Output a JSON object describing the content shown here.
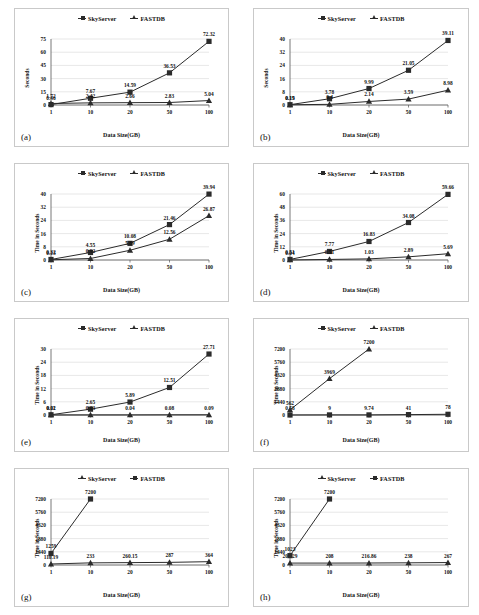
{
  "figure": {
    "panels": [
      {
        "tag": "(a)",
        "ylabel": "Seconds",
        "xlabel": "Data Size(GB)",
        "legend": [
          {
            "name": "SkyServer",
            "marker": "square"
          },
          {
            "name": "FASTDB",
            "marker": "triangle"
          }
        ],
        "chart_data": {
          "type": "line",
          "title": "",
          "xlabel": "Data Size(GB)",
          "ylabel": "Seconds",
          "categories": [
            "1",
            "10",
            "20",
            "50",
            "100"
          ],
          "yticks": [
            0,
            15,
            30,
            45,
            60,
            75
          ],
          "ylim": [
            0,
            75
          ],
          "grid": true,
          "legend_position": "top-center",
          "series": [
            {
              "name": "SkyServer",
              "marker": "square",
              "values": [
                0.46,
                7.67,
                14.59,
                36.53,
                72.32
              ],
              "labels": [
                "0.46",
                "7.67",
                "14.59",
                "36.53",
                "72.32"
              ]
            },
            {
              "name": "FASTDB",
              "marker": "triangle",
              "values": [
                1.72,
                2.42,
                2.66,
                2.83,
                5.04
              ],
              "labels": [
                "1.72",
                "2.42",
                "2.66",
                "2.83",
                "5.04"
              ]
            }
          ]
        }
      },
      {
        "tag": "(b)",
        "ylabel": "Seconds",
        "xlabel": "Data Size(GB)",
        "legend": [
          {
            "name": "SkyServer",
            "marker": "square"
          },
          {
            "name": "FASTDB",
            "marker": "triangle"
          }
        ],
        "chart_data": {
          "type": "line",
          "title": "",
          "xlabel": "Data Size(GB)",
          "ylabel": "Seconds",
          "categories": [
            "1",
            "10",
            "20",
            "50",
            "100"
          ],
          "yticks": [
            0,
            8,
            16,
            24,
            32,
            40
          ],
          "ylim": [
            0,
            40
          ],
          "grid": true,
          "legend_position": "top-center",
          "series": [
            {
              "name": "SkyServer",
              "marker": "square",
              "values": [
                0.19,
                3.78,
                9.99,
                21.05,
                39.11
              ],
              "labels": [
                "0.19",
                "3.78",
                "9.99",
                "21.05",
                "39.11"
              ]
            },
            {
              "name": "FASTDB",
              "marker": "triangle",
              "values": [
                0.15,
                0.4,
                2.14,
                3.59,
                8.98
              ],
              "labels": [
                "0.15",
                "0.4",
                "2.14",
                "3.59",
                "8.98"
              ]
            }
          ]
        }
      },
      {
        "tag": "(c)",
        "ylabel": "Time in Seconds",
        "xlabel": "Data Size(GB)",
        "legend": [
          {
            "name": "SkyServer",
            "marker": "square"
          },
          {
            "name": "FASTDB",
            "marker": "triangle"
          }
        ],
        "chart_data": {
          "type": "line",
          "title": "",
          "xlabel": "Data Size(GB)",
          "ylabel": "Time in Seconds",
          "categories": [
            "1",
            "10",
            "20",
            "50",
            "100"
          ],
          "yticks": [
            0,
            8,
            16,
            24,
            32,
            40
          ],
          "ylim": [
            0,
            40
          ],
          "grid": true,
          "legend_position": "top-center",
          "series": [
            {
              "name": "SkyServer",
              "marker": "square",
              "values": [
                0.32,
                4.55,
                10.08,
                21.46,
                39.94
              ],
              "labels": [
                "0.32",
                "4.55",
                "10.08",
                "21.46",
                "39.94"
              ]
            },
            {
              "name": "FASTDB",
              "marker": "triangle",
              "values": [
                0.13,
                0.92,
                5.89,
                12.56,
                26.87
              ],
              "labels": [
                "0.13",
                "0.92",
                "5.89",
                "12.56",
                "26.87"
              ]
            }
          ]
        }
      },
      {
        "tag": "(d)",
        "ylabel": "Time in Seconds",
        "xlabel": "Data Size(GB)",
        "legend": [
          {
            "name": "SkyServer",
            "marker": "square"
          },
          {
            "name": "FASTDB",
            "marker": "triangle"
          }
        ],
        "chart_data": {
          "type": "line",
          "title": "",
          "xlabel": "Data Size(GB)",
          "ylabel": "Time in Seconds",
          "categories": [
            "1",
            "10",
            "20",
            "50",
            "100"
          ],
          "yticks": [
            0,
            12,
            24,
            36,
            48,
            60
          ],
          "ylim": [
            0,
            60
          ],
          "grid": true,
          "legend_position": "top-center",
          "series": [
            {
              "name": "SkyServer",
              "marker": "square",
              "values": [
                0.51,
                7.77,
                16.83,
                34.08,
                59.66
              ],
              "labels": [
                "0.51",
                "7.77",
                "16.83",
                "34.08",
                "59.66"
              ]
            },
            {
              "name": "FASTDB",
              "marker": "triangle",
              "values": [
                0.04,
                0.51,
                1.03,
                2.89,
                5.69
              ],
              "labels": [
                "0.04",
                "0.51",
                "1.03",
                "2.89",
                "5.69"
              ]
            }
          ]
        }
      },
      {
        "tag": "(e)",
        "ylabel": "Time in Seconds",
        "xlabel": "Data Size(GB)",
        "legend": [
          {
            "name": "SkyServer",
            "marker": "square"
          },
          {
            "name": "FASTDB",
            "marker": "triangle"
          }
        ],
        "chart_data": {
          "type": "line",
          "title": "",
          "xlabel": "Data Size(GB)",
          "ylabel": "Time in Seconds",
          "categories": [
            "1",
            "10",
            "20",
            "50",
            "100"
          ],
          "yticks": [
            0,
            6,
            12,
            18,
            24,
            30
          ],
          "ylim": [
            0,
            30
          ],
          "grid": true,
          "legend_position": "top-center",
          "series": [
            {
              "name": "SkyServer",
              "marker": "square",
              "values": [
                0.11,
                2.65,
                5.89,
                12.51,
                27.71
              ],
              "labels": [
                "0.11",
                "2.65",
                "5.89",
                "12.51",
                "27.71"
              ]
            },
            {
              "name": "FASTDB",
              "marker": "triangle",
              "values": [
                0.02,
                0.03,
                0.04,
                0.08,
                0.09
              ],
              "labels": [
                "0.02",
                "0.03",
                "0.04",
                "0.08",
                "0.09"
              ]
            }
          ]
        }
      },
      {
        "tag": "(f)",
        "ylabel": "Time in Seconds",
        "xlabel": "Data Size(GB)",
        "legend": [
          {
            "name": "SkyServer",
            "marker": "square"
          },
          {
            "name": "FASTDB",
            "marker": "triangle"
          }
        ],
        "chart_data": {
          "type": "line",
          "title": "",
          "xlabel": "Data Size(GB)",
          "ylabel": "Time in Seconds",
          "categories": [
            "1",
            "10",
            "20",
            "50",
            "100"
          ],
          "yticks": [
            0,
            1440,
            2880,
            4320,
            5760,
            7200
          ],
          "ylim": [
            0,
            7200
          ],
          "grid": true,
          "legend_position": "top-center",
          "series": [
            {
              "name": "SkyServer",
              "marker": "square",
              "values": [
                0.58,
                9,
                9.74,
                41,
                78
              ],
              "labels": [
                "0.58",
                "9",
                "9.74",
                "41",
                "78"
              ]
            },
            {
              "name": "FASTDB",
              "marker": "triangle",
              "values": [
                562,
                3969,
                7200,
                null,
                null
              ],
              "labels": [
                "562",
                "3969",
                "7200",
                "",
                ""
              ]
            }
          ]
        }
      },
      {
        "tag": "(g)",
        "ylabel": "Time in Seconds",
        "xlabel": "Data Size(GB)",
        "legend": [
          {
            "name": "SkyServer",
            "marker": "triangle"
          },
          {
            "name": "FASTDB",
            "marker": "square"
          }
        ],
        "chart_data": {
          "type": "line",
          "title": "",
          "xlabel": "Data Size(GB)",
          "ylabel": "Time in Seconds",
          "categories": [
            "1",
            "10",
            "20",
            "50",
            "100"
          ],
          "yticks": [
            0,
            1440,
            2880,
            4320,
            5760,
            7200
          ],
          "ylim": [
            0,
            7200
          ],
          "grid": true,
          "legend_position": "top-center",
          "series": [
            {
              "name": "SkyServer",
              "marker": "triangle",
              "values": [
                110.19,
                233,
                260.15,
                287,
                364
              ],
              "labels": [
                "110.19",
                "233",
                "260.15",
                "287",
                "364"
              ]
            },
            {
              "name": "FASTDB",
              "marker": "square",
              "values": [
                1259,
                7200,
                null,
                null,
                null
              ],
              "labels": [
                "1259",
                "7200",
                "",
                "",
                ""
              ]
            }
          ]
        }
      },
      {
        "tag": "(h)",
        "ylabel": "Time in Seconds",
        "xlabel": "Data Size(GB)",
        "legend": [
          {
            "name": "SkyServer",
            "marker": "triangle"
          },
          {
            "name": "FASTDB",
            "marker": "square"
          }
        ],
        "chart_data": {
          "type": "line",
          "title": "",
          "xlabel": "Data Size(GB)",
          "ylabel": "Time in Seconds",
          "categories": [
            "1",
            "10",
            "20",
            "50",
            "100"
          ],
          "yticks": [
            0,
            1440,
            2880,
            4320,
            5760,
            7200
          ],
          "ylim": [
            0,
            7200
          ],
          "grid": true,
          "legend_position": "top-center",
          "series": [
            {
              "name": "SkyServer",
              "marker": "triangle",
              "values": [
                208.29,
                208,
                216.86,
                238,
                267
              ],
              "labels": [
                "208.29",
                "208",
                "216.86",
                "238",
                "267"
              ]
            },
            {
              "name": "FASTDB",
              "marker": "square",
              "values": [
                1023,
                7200,
                null,
                null,
                null
              ],
              "labels": [
                "1023",
                "7200",
                "",
                "",
                ""
              ]
            }
          ]
        }
      }
    ]
  },
  "colors": {
    "line": "#2b2b2b",
    "grid": "#d6d6d6",
    "axis": "#555555",
    "panel_border": "#c9c9c9",
    "background": "#ffffff"
  }
}
